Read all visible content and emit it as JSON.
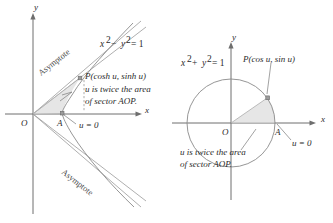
{
  "figure": {
    "background_color": "#ffffff",
    "ink_color": "#2b2b2b",
    "curve_color": "#8a8a8a",
    "sector_fill_color": "#d9d9d9"
  },
  "left_panel": {
    "name": "hyperbola-panel",
    "equation": {
      "base": "x",
      "full": "x2 − y2 = 1",
      "part1_base": "x",
      "part1_exp": "2",
      "operator": "−",
      "part2_base": "y",
      "part2_exp": "2",
      "equals": "= 1"
    },
    "axis_x_label": "x",
    "axis_y_label": "y",
    "origin_label": "O",
    "point_a_label": "A",
    "point_p_label": "P(cosh u, sinh u)",
    "u_zero_label": "u = 0",
    "note_line1": "u is twice the area",
    "note_line2": "of sector AOP.",
    "asymptote_upper_label": "Asymptote",
    "asymptote_lower_label": "Asymptote",
    "curve_type": "hyperbola"
  },
  "right_panel": {
    "name": "circle-panel",
    "equation": {
      "full": "x2 + y2 = 1",
      "part1_base": "x",
      "part1_exp": "2",
      "operator": "+",
      "part2_base": "y",
      "part2_exp": "2",
      "equals": "= 1"
    },
    "axis_x_label": "x",
    "axis_y_label": "y",
    "origin_label": "O",
    "point_a_label": "A",
    "point_p_label": "P(cos u, sin u)",
    "u_zero_label": "u = 0",
    "note_line1": "u is twice the area",
    "note_line2": "of sector AOP.",
    "curve_type": "circle",
    "circle_radius_units": 1
  }
}
